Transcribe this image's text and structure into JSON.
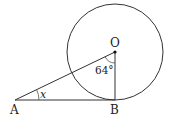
{
  "diagram": {
    "type": "geometry-tangent",
    "points": {
      "O": {
        "label": "O"
      },
      "A": {
        "label": "A"
      },
      "B": {
        "label": "B"
      }
    },
    "angles": {
      "AOB": {
        "label": "64°"
      },
      "OAB": {
        "label": "x"
      }
    },
    "colors": {
      "stroke": "#333333",
      "background": "#ffffff"
    }
  }
}
